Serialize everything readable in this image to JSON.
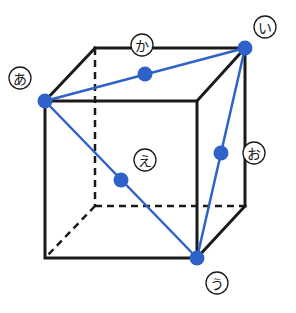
{
  "diagram": {
    "type": "cube-with-diagonals",
    "colors": {
      "edge": "#1a1a1a",
      "accent": "#2f62c8",
      "dot": "#2f62c8",
      "background": "#ffffff"
    },
    "cube": {
      "front_face": {
        "top_left": [
          45,
          101
        ],
        "top_right": [
          197,
          101
        ],
        "bottom_left": [
          45,
          258
        ],
        "bottom_right": [
          197,
          258
        ]
      },
      "back_face": {
        "top_left": [
          95,
          48
        ],
        "top_right": [
          245,
          48
        ],
        "bottom_left": [
          95,
          206
        ],
        "bottom_right": [
          245,
          206
        ]
      }
    },
    "points": [
      {
        "id": "a",
        "label": "あ",
        "pos": [
          45,
          101
        ],
        "label_pos": [
          20,
          78
        ],
        "kind": "vertex"
      },
      {
        "id": "i",
        "label": "い",
        "pos": [
          245,
          48
        ],
        "label_pos": [
          265,
          27
        ],
        "kind": "vertex"
      },
      {
        "id": "u",
        "label": "う",
        "pos": [
          197,
          258
        ],
        "label_pos": [
          217,
          283
        ],
        "kind": "vertex"
      },
      {
        "id": "e",
        "label": "え",
        "pos": [
          121,
          180
        ],
        "label_pos": [
          145,
          160
        ],
        "kind": "midpoint"
      },
      {
        "id": "o",
        "label": "お",
        "pos": [
          221,
          153
        ],
        "label_pos": [
          254,
          153
        ],
        "kind": "midpoint"
      },
      {
        "id": "ka",
        "label": "か",
        "pos": [
          145,
          74
        ],
        "label_pos": [
          142,
          45
        ],
        "kind": "midpoint"
      }
    ],
    "blue_segments": [
      {
        "from": "a",
        "to": "i"
      },
      {
        "from": "a",
        "to": "u"
      },
      {
        "from": "i",
        "to": "u"
      }
    ]
  }
}
